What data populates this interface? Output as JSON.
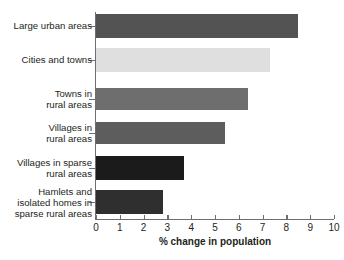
{
  "chart_data": {
    "type": "bar",
    "orientation": "horizontal",
    "title": "",
    "xlabel": "% change in population",
    "ylabel": "",
    "xlim": [
      0,
      10
    ],
    "xticks": [
      0,
      1,
      2,
      3,
      4,
      5,
      6,
      7,
      8,
      9,
      10
    ],
    "xtick_labels": [
      "0",
      "1",
      "2",
      "3",
      "4",
      "5",
      "6",
      "7",
      "8",
      "9",
      "10"
    ],
    "grid": false,
    "legend": "none",
    "categories": [
      "Large urban areas",
      "Cities and towns",
      "Towns in\nrural areas",
      "Villages in\nrural areas",
      "Villages in sparse\nrural areas",
      "Hamlets and\nisolated homes in\nsparse rural areas"
    ],
    "values": [
      8.5,
      7.3,
      6.4,
      5.4,
      3.7,
      2.8
    ],
    "bar_colors": [
      "#535353",
      "#dfdfdf",
      "#6e6e6e",
      "#5d5d5d",
      "#1b1b1b",
      "#2f2f2f"
    ],
    "axis_color": "#6d6e71",
    "text_color": "#231f20",
    "background_color": "#ffffff"
  }
}
